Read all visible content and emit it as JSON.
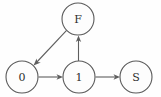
{
  "diagram": {
    "background_color": "#fefefe",
    "stroke_color": "#5e5e5e",
    "label_color": "#2e2e2e",
    "nodes": [
      {
        "id": "F",
        "label": "F",
        "cx": 78,
        "cy": 19,
        "r": 16
      },
      {
        "id": "0",
        "label": "0",
        "cx": 22,
        "cy": 77,
        "r": 16
      },
      {
        "id": "1",
        "label": "1",
        "cx": 79,
        "cy": 77,
        "r": 16
      },
      {
        "id": "S",
        "label": "S",
        "cx": 136,
        "cy": 77,
        "r": 16
      }
    ],
    "edges": [
      {
        "id": "edge-0-to-1",
        "from": "0",
        "to": "1",
        "label": "",
        "directed": true
      },
      {
        "id": "edge-1-to-s",
        "from": "1",
        "to": "S",
        "label": "",
        "directed": true
      },
      {
        "id": "edge-1-to-f",
        "from": "1",
        "to": "F",
        "label": "",
        "directed": true
      },
      {
        "id": "edge-f-to-0",
        "from": "F",
        "to": "0",
        "label": "",
        "directed": true
      }
    ]
  }
}
